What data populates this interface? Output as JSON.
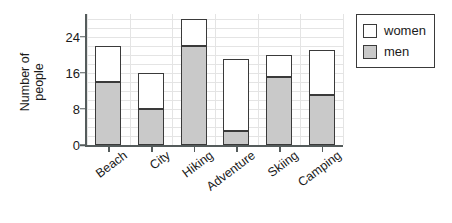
{
  "chart_data": {
    "type": "bar",
    "subtype": "stacked-bar",
    "title": "",
    "xlabel": "",
    "ylabel": "Number of people",
    "ylabel_lines": [
      "Number of",
      "people"
    ],
    "categories": [
      "Beach",
      "City",
      "Hiking",
      "Adventure",
      "Skiing",
      "Camping"
    ],
    "series": [
      {
        "name": "men",
        "color": "#c9c9c9",
        "values": [
          14,
          8,
          22,
          3,
          15,
          11
        ]
      },
      {
        "name": "women",
        "color": "#ffffff",
        "values": [
          8,
          8,
          6,
          16,
          5,
          10
        ]
      }
    ],
    "totals": [
      22,
      16,
      28,
      19,
      20,
      21
    ],
    "ylim": [
      0,
      29
    ],
    "yticks": [
      0,
      8,
      16,
      24
    ],
    "ytick_labels": [
      "0",
      "8",
      "16",
      "24"
    ],
    "minor_gridline_step": 2,
    "grid": true,
    "legend": {
      "position": "right",
      "entries": [
        {
          "label": "women",
          "swatch_color": "#ffffff"
        },
        {
          "label": "men",
          "swatch_color": "#c9c9c9"
        }
      ]
    },
    "axis_color": "#555c5c",
    "bar_outline_color": "#3a3a3a",
    "grid_color": "#e4e4e4"
  }
}
